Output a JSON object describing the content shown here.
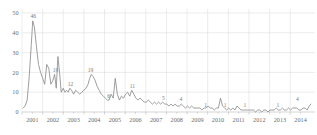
{
  "chart": {
    "type": "line",
    "title": "",
    "xlabel": "",
    "ylabel": "",
    "grid": true,
    "legend": "none"
  },
  "axes": {
    "y_ticks": [
      "0",
      "10",
      "20",
      "30",
      "40",
      "50"
    ],
    "y_values": [
      0,
      10,
      20,
      30,
      40,
      50
    ],
    "ylim": [
      0,
      52
    ],
    "x_ticks": [
      "2001",
      "2002",
      "2003",
      "2004",
      "2005",
      "2006",
      "2007",
      "2008",
      "2009",
      "2010",
      "2011",
      "2012",
      "2013",
      "2014"
    ],
    "xlim": [
      2001,
      2015.2
    ]
  },
  "annotations": [
    {
      "label": "46",
      "x": 2001.55,
      "y": 46
    },
    {
      "label": "19",
      "x": 2002.62,
      "y": 19
    },
    {
      "label": "12",
      "x": 2003.35,
      "y": 12
    },
    {
      "label": "19",
      "x": 2004.32,
      "y": 19
    },
    {
      "label": "6",
      "x": 2005.2,
      "y": 6
    },
    {
      "label": "11",
      "x": 2006.35,
      "y": 11
    },
    {
      "label": "5",
      "x": 2007.85,
      "y": 5
    },
    {
      "label": "4",
      "x": 2008.7,
      "y": 4
    },
    {
      "label": "1",
      "x": 2009.9,
      "y": 1
    },
    {
      "label": "1",
      "x": 2010.85,
      "y": 1
    },
    {
      "label": "1",
      "x": 2011.8,
      "y": 1
    },
    {
      "label": "1",
      "x": 2013.4,
      "y": 1
    },
    {
      "label": "4",
      "x": 2014.35,
      "y": 4
    }
  ],
  "chart_data": {
    "type": "line",
    "title": "",
    "xlabel": "",
    "ylabel": "",
    "ylim": [
      0,
      52
    ],
    "xlim": [
      2001,
      2015.2
    ],
    "grid": true,
    "legend": "none",
    "xtick_labels": [
      "2001",
      "2002",
      "2003",
      "2004",
      "2005",
      "2006",
      "2007",
      "2008",
      "2009",
      "2010",
      "2011",
      "2012",
      "2013",
      "2014"
    ],
    "ytick_labels": [
      "0",
      "10",
      "20",
      "30",
      "40",
      "50"
    ],
    "data_labels": [
      "46",
      "19",
      "12",
      "19",
      "6",
      "11",
      "5",
      "4",
      "1",
      "1",
      "1",
      "1",
      "4"
    ],
    "series": [
      {
        "name": "count",
        "x": [
          2001.05,
          2001.15,
          2001.25,
          2001.35,
          2001.45,
          2001.52,
          2001.6,
          2001.7,
          2001.8,
          2001.9,
          2002.0,
          2002.1,
          2002.2,
          2002.3,
          2002.4,
          2002.5,
          2002.58,
          2002.66,
          2002.74,
          2002.82,
          2002.9,
          2003.0,
          2003.08,
          2003.16,
          2003.24,
          2003.32,
          2003.4,
          2003.5,
          2003.6,
          2003.7,
          2003.8,
          2003.9,
          2004.0,
          2004.1,
          2004.2,
          2004.28,
          2004.36,
          2004.44,
          2004.54,
          2004.64,
          2004.74,
          2004.84,
          2004.94,
          2005.04,
          2005.14,
          2005.22,
          2005.32,
          2005.42,
          2005.52,
          2005.62,
          2005.72,
          2005.82,
          2005.92,
          2006.02,
          2006.12,
          2006.22,
          2006.32,
          2006.42,
          2006.52,
          2006.62,
          2006.72,
          2006.82,
          2006.92,
          2007.02,
          2007.12,
          2007.22,
          2007.32,
          2007.42,
          2007.52,
          2007.62,
          2007.72,
          2007.82,
          2007.92,
          2008.02,
          2008.12,
          2008.22,
          2008.32,
          2008.42,
          2008.52,
          2008.62,
          2008.72,
          2008.82,
          2008.92,
          2009.02,
          2009.12,
          2009.22,
          2009.32,
          2009.42,
          2009.52,
          2009.62,
          2009.72,
          2009.82,
          2009.92,
          2010.02,
          2010.12,
          2010.22,
          2010.32,
          2010.42,
          2010.52,
          2010.62,
          2010.72,
          2010.82,
          2010.92,
          2011.02,
          2011.12,
          2011.22,
          2011.32,
          2011.42,
          2011.52,
          2011.62,
          2011.72,
          2011.82,
          2011.92,
          2012.02,
          2012.12,
          2012.22,
          2012.32,
          2012.42,
          2012.52,
          2012.62,
          2012.72,
          2012.82,
          2012.92,
          2013.02,
          2013.12,
          2013.22,
          2013.32,
          2013.42,
          2013.52,
          2013.62,
          2013.72,
          2013.82,
          2013.92,
          2014.02,
          2014.12,
          2014.22,
          2014.32,
          2014.42,
          2014.52,
          2014.62,
          2014.72,
          2014.82,
          2014.92,
          2015.0
        ],
        "values": [
          2,
          3,
          6,
          18,
          34,
          46,
          43,
          33,
          24,
          20,
          17,
          14,
          24,
          22,
          14,
          16,
          19,
          12,
          28,
          20,
          10,
          12,
          10,
          11,
          10,
          12,
          11,
          9,
          11,
          10,
          9,
          10,
          11,
          12,
          14,
          17,
          19,
          18,
          16,
          13,
          11,
          9,
          8,
          7,
          6,
          6,
          9,
          7,
          17,
          9,
          6,
          8,
          7,
          9,
          10,
          8,
          11,
          9,
          7,
          6,
          7,
          6,
          5,
          5,
          6,
          5,
          4,
          5,
          4,
          5,
          4,
          5,
          4,
          4,
          3,
          4,
          3,
          4,
          3,
          3,
          4,
          3,
          2,
          3,
          2,
          3,
          2,
          2,
          2,
          2,
          1,
          2,
          2,
          3,
          2,
          2,
          1,
          2,
          2,
          7,
          3,
          2,
          1,
          2,
          1,
          2,
          1,
          3,
          2,
          1,
          1,
          1,
          1,
          1,
          1,
          1,
          0,
          1,
          1,
          0,
          1,
          1,
          0,
          1,
          1,
          1,
          2,
          1,
          1,
          2,
          1,
          1,
          2,
          1,
          2,
          2,
          2,
          1,
          1,
          2,
          2,
          1,
          3,
          4
        ]
      }
    ]
  }
}
